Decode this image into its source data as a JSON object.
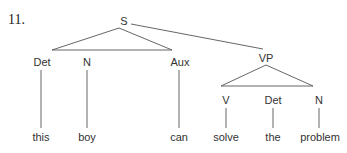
{
  "example_number": "11.",
  "tree": {
    "root": "S",
    "nodes": {
      "S": "S",
      "det1": "Det",
      "n1": "N",
      "aux": "Aux",
      "vp": "VP",
      "v": "V",
      "det2": "Det",
      "n2": "N"
    },
    "leaves": {
      "this": "this",
      "boy": "boy",
      "can": "can",
      "solve": "solve",
      "the": "the",
      "problem": "problem"
    }
  },
  "colors": {
    "line": "#444444",
    "text": "#333333"
  }
}
